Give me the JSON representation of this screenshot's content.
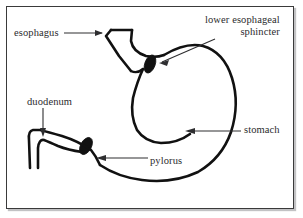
{
  "figure": {
    "frame_color": "#3a3a3a",
    "background_color": "#ffffff",
    "outline_color": "#111111",
    "label_color": "#2b2b2d",
    "leader_color": "#2e2e30",
    "sphincter_fill": "#111111"
  },
  "labels": {
    "esophagus": "esophagus",
    "lower_esophageal_sphincter_line1": "lower esophageal",
    "lower_esophageal_sphincter_line2": "sphincter",
    "duodenum": "duodenum",
    "stomach": "stomach",
    "pylorus": "pylorus"
  },
  "structures": [
    {
      "name": "esophagus",
      "type": "tube",
      "label": "esophagus"
    },
    {
      "name": "lower-esophageal-sphincter",
      "type": "sphincter-oval",
      "label": "lower esophageal sphincter"
    },
    {
      "name": "stomach-body",
      "type": "organ-outline",
      "label": "stomach"
    },
    {
      "name": "pylorus",
      "type": "sphincter-oval",
      "label": "pylorus"
    },
    {
      "name": "duodenum",
      "type": "tube",
      "label": "duodenum"
    }
  ],
  "leaders": [
    {
      "name": "esophagus-leader",
      "from_label": "esophagus",
      "direction": "right",
      "target": "esophagus"
    },
    {
      "name": "les-leader",
      "from_label": "lower esophageal sphincter",
      "direction": "down-left",
      "target": "lower-esophageal-sphincter"
    },
    {
      "name": "duodenum-leader",
      "from_label": "duodenum",
      "direction": "down",
      "target": "duodenum"
    },
    {
      "name": "stomach-leader",
      "from_label": "stomach",
      "direction": "left",
      "target": "stomach-body"
    },
    {
      "name": "pylorus-leader",
      "from_label": "pylorus",
      "direction": "left",
      "target": "pylorus"
    }
  ]
}
